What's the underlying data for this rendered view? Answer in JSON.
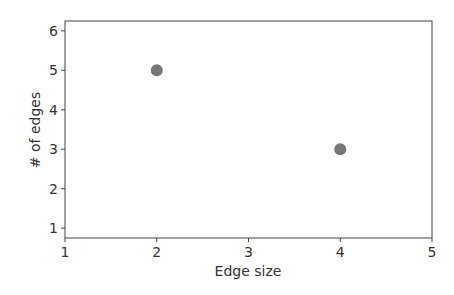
{
  "chart_data": {
    "type": "scatter",
    "title": "",
    "xlabel": "Edge size",
    "ylabel": "# of edges",
    "xlim": [
      1,
      5
    ],
    "ylim": [
      0.75,
      6.25
    ],
    "xticks": [
      "1",
      "2",
      "3",
      "4",
      "5"
    ],
    "yticks": [
      "1",
      "2",
      "3",
      "4",
      "5",
      "6"
    ],
    "grid": false,
    "legend": null,
    "series": [
      {
        "name": "edges",
        "x": [
          2,
          4
        ],
        "y": [
          5,
          3
        ],
        "color": "#777777"
      }
    ]
  }
}
